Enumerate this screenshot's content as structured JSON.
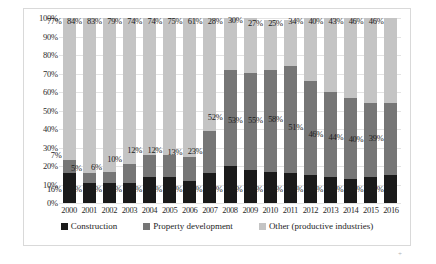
{
  "chart_data": {
    "type": "bar",
    "stacked": true,
    "normalized_percent": true,
    "title": "",
    "xlabel": "",
    "ylabel": "",
    "ylim": [
      0,
      100
    ],
    "ytick_labels": [
      "100%",
      "90%",
      "80%",
      "70%",
      "60%",
      "50%",
      "40%",
      "30%",
      "20%",
      "10%",
      "0%"
    ],
    "ytick_values": [
      100,
      90,
      80,
      70,
      60,
      50,
      40,
      30,
      20,
      10,
      0
    ],
    "grid": true,
    "legend_position": "bottom",
    "categories": [
      "2000",
      "2001",
      "2002",
      "2003",
      "2004",
      "2005",
      "2006",
      "2007",
      "2008",
      "2009",
      "2010",
      "2011",
      "2012",
      "2013",
      "2014",
      "2015",
      "2016"
    ],
    "series": [
      {
        "name": "Construction",
        "color": "#1a1a1a",
        "values": [
          16,
          11,
          11,
          11,
          14,
          14,
          12,
          16,
          20,
          18,
          17,
          16,
          15,
          14,
          13,
          14,
          15
        ],
        "labels": [
          "16%",
          "11%",
          "11%",
          "11%",
          "14%",
          "14%",
          "12%",
          "16%",
          "20%",
          "18%",
          "17%",
          "16%",
          "15%",
          "14%",
          "13%",
          "14%",
          "15%"
        ]
      },
      {
        "name": "Property development",
        "color": "#767676",
        "values": [
          7,
          5,
          6,
          10,
          12,
          12,
          13,
          23,
          52,
          53,
          55,
          58,
          51,
          46,
          44,
          40,
          39
        ],
        "labels": [
          "7%",
          "5%",
          "6%",
          "10%",
          "12%",
          "12%",
          "13%",
          "23%",
          "52%",
          "53%",
          "55%",
          "58%",
          "51%",
          "46%",
          "44%",
          "40%",
          "39%"
        ]
      },
      {
        "name": "Other (productive industries)",
        "color": "#c4c4c4",
        "values": [
          77,
          84,
          83,
          79,
          74,
          74,
          75,
          61,
          28,
          30,
          27,
          25,
          34,
          40,
          43,
          46,
          46
        ],
        "labels": [
          "77%",
          "84%",
          "83%",
          "79%",
          "74%",
          "74%",
          "75%",
          "61%",
          "28%",
          "30%",
          "27%",
          "25%",
          "34%",
          "40%",
          "43%",
          "46%",
          "46%"
        ]
      }
    ]
  }
}
